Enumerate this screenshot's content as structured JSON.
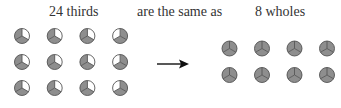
{
  "labels": {
    "left": "24 thirds",
    "middle": "are the same as",
    "right": "8 wholes"
  },
  "colors": {
    "shaded": "#8e8e8e",
    "unshaded": "#ffffff",
    "outline": "#555555",
    "arrow": "#111111"
  },
  "left_group": {
    "rows": 3,
    "cols": 4,
    "parts_per_circle": 3,
    "shaded_parts_per_circle": 2,
    "unshaded_sector": [
      [
        "upper-right",
        "upper-right",
        "upper-right",
        "upper-left"
      ],
      [
        "upper-right",
        "upper-right",
        "upper-right",
        "upper-left"
      ],
      [
        "upper-right",
        "upper-right",
        "upper-right",
        "upper-left"
      ]
    ]
  },
  "right_group": {
    "rows": 2,
    "cols": 4,
    "parts_per_circle": 3,
    "shaded_parts_per_circle": 3
  },
  "arrow": {
    "direction": "right"
  }
}
